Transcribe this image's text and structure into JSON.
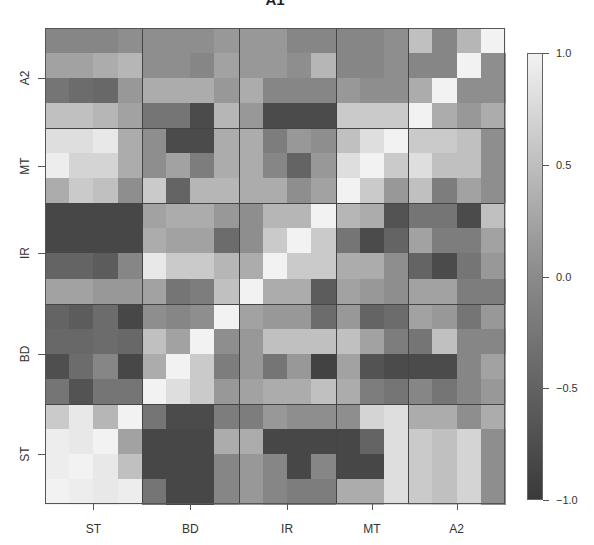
{
  "chart_data": {
    "type": "heatmap",
    "title": "A1",
    "xlabel": "",
    "ylabel": "",
    "groups": [
      {
        "name": "ST",
        "size": 4
      },
      {
        "name": "BD",
        "size": 4
      },
      {
        "name": "IR",
        "size": 4
      },
      {
        "name": "MT",
        "size": 3
      },
      {
        "name": "A2",
        "size": 4
      }
    ],
    "x_tick_labels": [
      "ST",
      "BD",
      "IR",
      "MT",
      "A2"
    ],
    "y_tick_labels_bottom_to_top": [
      "ST",
      "BD",
      "IR",
      "MT",
      "A2"
    ],
    "color_scale": {
      "min": -1.0,
      "max": 1.0,
      "low_color": "#3a3a3a",
      "mid_color": "#8e8e8e",
      "high_color": "#f2f2f2"
    },
    "colorbar_ticks": [
      "1.0",
      "0.5",
      "0.0",
      "-0.5",
      "-1.0"
    ],
    "grid": false,
    "legend_position": "right",
    "rows_top_to_bottom": [
      {
        "group": "A2",
        "values": [
          -0.1,
          -0.1,
          -0.1,
          0.0,
          0.0,
          0.0,
          0.0,
          0.1,
          0.1,
          0.1,
          -0.1,
          -0.1,
          -0.1,
          -0.1,
          0.0,
          0.5,
          -0.1,
          0.4,
          1.0
        ]
      },
      {
        "group": "A2",
        "values": [
          0.2,
          0.2,
          0.3,
          0.4,
          0.0,
          0.0,
          -0.1,
          0.2,
          0.1,
          0.1,
          0.0,
          0.4,
          -0.1,
          -0.1,
          0.0,
          -0.1,
          -0.1,
          1.0,
          0.0
        ]
      },
      {
        "group": "A2",
        "values": [
          -0.3,
          -0.4,
          -0.45,
          0.1,
          0.3,
          0.3,
          0.3,
          0.1,
          0.3,
          -0.1,
          -0.1,
          -0.1,
          0.1,
          0.0,
          0.0,
          0.3,
          1.0,
          0.0,
          0.0
        ]
      },
      {
        "group": "A2",
        "values": [
          0.5,
          0.5,
          0.4,
          0.2,
          -0.3,
          -0.3,
          -0.8,
          0.4,
          0.1,
          -0.8,
          -0.8,
          -0.8,
          0.6,
          0.6,
          0.6,
          1.0,
          0.3,
          0.1,
          0.3
        ]
      },
      {
        "group": "MT",
        "values": [
          0.8,
          0.8,
          0.9,
          0.3,
          0.0,
          -0.8,
          -0.8,
          0.3,
          0.3,
          -0.2,
          0.1,
          0.0,
          0.5,
          0.8,
          1.0,
          0.6,
          0.6,
          0.5,
          0.0
        ]
      },
      {
        "group": "MT",
        "values": [
          0.95,
          0.7,
          0.7,
          0.3,
          0.0,
          0.2,
          -0.2,
          0.3,
          0.3,
          -0.1,
          -0.5,
          0.1,
          0.8,
          1.0,
          0.6,
          0.8,
          0.5,
          0.5,
          0.0
        ]
      },
      {
        "group": "MT",
        "values": [
          0.3,
          0.6,
          0.5,
          0.0,
          0.6,
          -0.5,
          0.4,
          0.4,
          0.3,
          0.3,
          0.0,
          0.2,
          1.0,
          0.6,
          0.1,
          0.5,
          -0.2,
          0.2,
          0.0
        ]
      },
      {
        "group": "IR",
        "values": [
          -0.85,
          -0.85,
          -0.85,
          -0.85,
          0.2,
          0.3,
          0.3,
          0.1,
          0.0,
          0.4,
          0.4,
          1.0,
          0.4,
          0.3,
          -0.7,
          -0.3,
          -0.3,
          -0.8,
          0.5
        ]
      },
      {
        "group": "IR",
        "values": [
          -0.85,
          -0.85,
          -0.85,
          -0.85,
          0.3,
          0.2,
          0.2,
          -0.4,
          0.0,
          0.6,
          1.0,
          0.6,
          -0.3,
          -0.8,
          -0.5,
          0.2,
          -0.2,
          -0.2,
          0.2
        ]
      },
      {
        "group": "IR",
        "values": [
          -0.5,
          -0.5,
          -0.6,
          -0.1,
          0.9,
          0.6,
          0.6,
          0.4,
          0.3,
          1.0,
          0.6,
          0.6,
          0.3,
          0.3,
          0.0,
          -0.5,
          -0.8,
          -0.3,
          0.1
        ]
      },
      {
        "group": "IR",
        "values": [
          0.2,
          0.2,
          0.1,
          0.1,
          0.2,
          -0.3,
          -0.2,
          0.5,
          1.0,
          0.3,
          0.3,
          -0.6,
          0.2,
          0.1,
          0.0,
          0.2,
          0.2,
          -0.2,
          -0.2
        ]
      },
      {
        "group": "BD",
        "values": [
          -0.5,
          -0.6,
          -0.4,
          -0.85,
          0.0,
          -0.1,
          0.0,
          1.0,
          0.2,
          0.1,
          0.1,
          -0.4,
          0.1,
          -0.5,
          -0.4,
          0.2,
          0.1,
          -0.3,
          0.1
        ]
      },
      {
        "group": "BD",
        "values": [
          -0.45,
          -0.45,
          -0.4,
          -0.45,
          0.5,
          0.2,
          1.0,
          0.0,
          0.1,
          0.5,
          0.5,
          0.5,
          0.5,
          0.2,
          -0.2,
          -0.3,
          0.5,
          -0.1,
          -0.1
        ]
      },
      {
        "group": "BD",
        "values": [
          -0.75,
          -0.4,
          -0.1,
          -0.85,
          0.3,
          1.0,
          0.6,
          -0.2,
          0.1,
          -0.3,
          0.1,
          -0.9,
          0.2,
          -0.7,
          -0.8,
          -0.8,
          -0.8,
          -0.1,
          0.2
        ]
      },
      {
        "group": "BD",
        "values": [
          -0.3,
          -0.7,
          -0.3,
          -0.3,
          1.0,
          0.8,
          0.6,
          0.1,
          0.2,
          0.3,
          0.3,
          0.5,
          0.3,
          -0.2,
          -0.3,
          -0.1,
          -0.3,
          -0.1,
          0.1
        ]
      },
      {
        "group": "ST",
        "values": [
          0.6,
          0.9,
          0.4,
          1.0,
          -0.3,
          -0.8,
          -0.8,
          -0.2,
          -0.2,
          0.1,
          0.0,
          0.0,
          0.0,
          0.7,
          0.8,
          0.3,
          0.3,
          0.0,
          0.3
        ]
      },
      {
        "group": "ST",
        "values": [
          0.95,
          0.9,
          1.0,
          0.2,
          -0.85,
          -0.85,
          -0.85,
          0.3,
          0.3,
          -0.85,
          -0.85,
          -0.85,
          -0.85,
          -0.5,
          0.8,
          0.6,
          0.5,
          0.7,
          0.0
        ]
      },
      {
        "group": "ST",
        "values": [
          0.95,
          1.0,
          0.9,
          0.5,
          -0.85,
          -0.85,
          -0.85,
          -0.1,
          0.1,
          -0.1,
          -0.85,
          -0.1,
          -0.85,
          -0.85,
          0.8,
          0.6,
          0.5,
          0.7,
          0.0
        ]
      },
      {
        "group": "ST",
        "values": [
          1.0,
          0.95,
          0.9,
          0.95,
          -0.3,
          -0.85,
          -0.85,
          -0.1,
          0.1,
          -0.1,
          -0.2,
          -0.2,
          0.3,
          0.3,
          0.8,
          0.6,
          0.5,
          0.7,
          0.0
        ]
      }
    ]
  }
}
